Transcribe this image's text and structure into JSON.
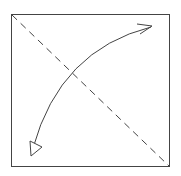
{
  "diagram": {
    "elements": [
      {
        "name": "paper-square",
        "kind": "square"
      },
      {
        "name": "fold-line",
        "kind": "dashed-diagonal",
        "from": "top-left",
        "to": "bottom-right"
      },
      {
        "name": "fold-arrow",
        "kind": "curved-double-arrow",
        "from": "bottom-left",
        "to": "top-right",
        "heads": [
          "hollow-triangle",
          "open-v"
        ]
      }
    ],
    "colors": {
      "stroke": "#333333",
      "background": "#ffffff"
    }
  }
}
